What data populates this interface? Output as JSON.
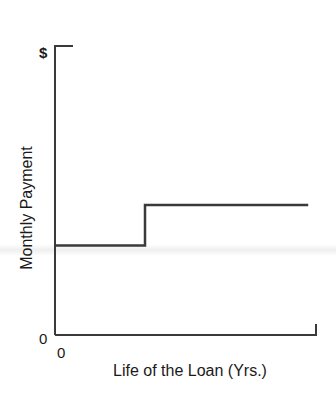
{
  "chart_data": {
    "type": "line",
    "subtype": "step",
    "title": "",
    "xlabel": "Life of the Loan (Yrs.)",
    "ylabel": "Monthly Payment",
    "x_tick_labels": [
      "0"
    ],
    "y_tick_labels": [
      "0",
      "$"
    ],
    "x": [
      0,
      0.345,
      0.345,
      0.97
    ],
    "series": [
      {
        "name": "Monthly Payment",
        "values": [
          0.31,
          0.31,
          0.45,
          0.45
        ],
        "note": "Payment stays flat at a lower level, then steps up once to a higher constant level for the remainder of the loan"
      }
    ],
    "xlim": [
      0,
      1
    ],
    "ylim": [
      0,
      1
    ],
    "grid": false,
    "legend": null,
    "line_color": "#3a3a3a"
  },
  "axes": {
    "y_top_label": "$",
    "y_origin_label": "0",
    "x_origin_label": "0",
    "y_title": "Monthly Payment",
    "x_title": "Life of the Loan (Yrs.)"
  }
}
